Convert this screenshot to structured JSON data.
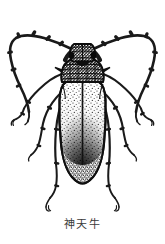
{
  "figure": {
    "caption": "神天牛",
    "subject_name": "longhorn-beetle-illustration",
    "style": "black-and-white engraving line art",
    "background_color": "#ffffff",
    "ink_color": "#1a1a1a",
    "caption_color": "#3a3a3a",
    "parts": {
      "antenna_left": "antenna-left",
      "antenna_right": "antenna-right",
      "head": "head",
      "pronotum": "pronotum",
      "elytra": "elytra",
      "leg_foreleft": "foreleg-left",
      "leg_foreright": "foreleg-right",
      "leg_midleft": "midleg-left",
      "leg_midright": "midleg-right",
      "leg_hindleft": "hindleg-left",
      "leg_hindright": "hindleg-right"
    }
  }
}
